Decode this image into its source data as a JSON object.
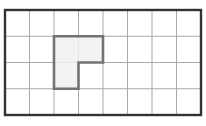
{
  "figure": {
    "type": "grid-polygon-diagram",
    "canvas": {
      "width": 206,
      "height": 126,
      "background": "#ffffff"
    },
    "grid": {
      "x": 5,
      "y": 10,
      "width": 196,
      "height": 105,
      "columns": 8,
      "rows": 4,
      "line_color": "#a9a9a9",
      "line_width": 1,
      "border_color": "#333333",
      "border_width": 2.4
    },
    "shape": {
      "label": "L-shaped highlighted region",
      "cells": [
        [
          2,
          1
        ],
        [
          3,
          1
        ],
        [
          2,
          2
        ]
      ],
      "cell_count": 3,
      "polygon_grid_points": [
        [
          2,
          1
        ],
        [
          4,
          1
        ],
        [
          4,
          2
        ],
        [
          3,
          2
        ],
        [
          3,
          3
        ],
        [
          2,
          3
        ]
      ],
      "fill_color": "#f1f1ef",
      "fill_opacity": 0.85,
      "outline_color": "#737373",
      "outline_width": 2.6
    }
  }
}
